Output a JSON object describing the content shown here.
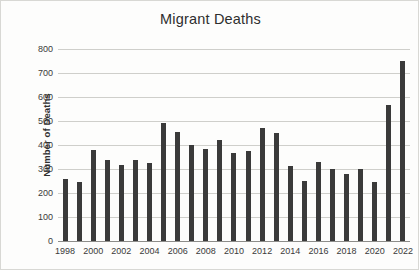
{
  "chart_data": {
    "type": "bar",
    "title": "Migrant Deaths",
    "xlabel": "",
    "ylabel": "Number of Deaths",
    "ylim": [
      0,
      800
    ],
    "ytick_step": 100,
    "yticks": [
      800,
      700,
      600,
      500,
      400,
      300,
      200,
      100,
      0
    ],
    "grid": true,
    "legend": false,
    "bar_color": "#3a3a3a",
    "gridline_color": "#cfcfcb",
    "categories": [
      "1998",
      "1999",
      "2000",
      "2001",
      "2002",
      "2003",
      "2004",
      "2005",
      "2006",
      "2007",
      "2008",
      "2009",
      "2010",
      "2011",
      "2012",
      "2013",
      "2014",
      "2015",
      "2016",
      "2017",
      "2018",
      "2019",
      "2020",
      "2021",
      "2022"
    ],
    "visible_xtick_labels": [
      "1998",
      "",
      "2000",
      "",
      "2002",
      "",
      "2004",
      "",
      "2006",
      "",
      "2008",
      "",
      "2010",
      "",
      "2012",
      "",
      "2014",
      "",
      "2016",
      "",
      "2018",
      "",
      "2020",
      "",
      "2022"
    ],
    "values": [
      260,
      245,
      378,
      336,
      316,
      336,
      323,
      492,
      453,
      398,
      383,
      419,
      365,
      375,
      471,
      451,
      314,
      249,
      329,
      298,
      281,
      300,
      245,
      566,
      748
    ]
  }
}
